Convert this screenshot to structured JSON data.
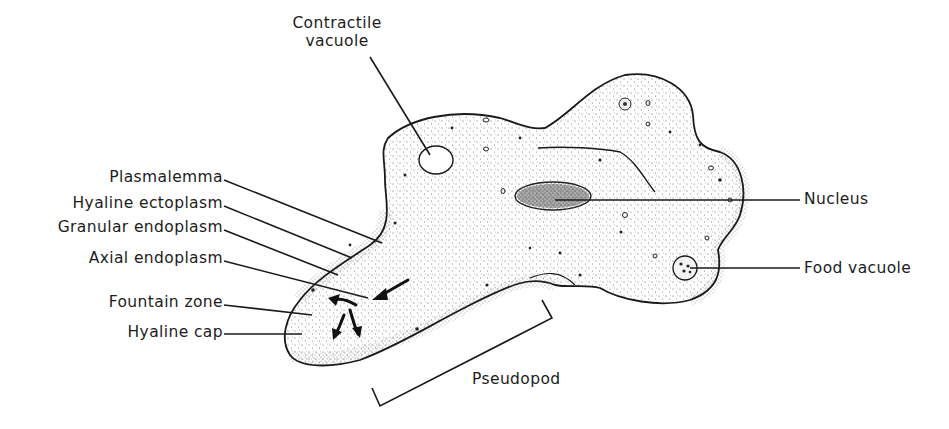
{
  "figure": {
    "colors": {
      "ink": "#1a1a1a",
      "background": "#ffffff",
      "stipple": "#3a3a3a"
    }
  },
  "labels": {
    "contractile_vacuole": [
      "Contractile",
      "vacuole"
    ],
    "plasmalemma": "Plasmalemma",
    "hyaline_ectoplasm": "Hyaline ectoplasm",
    "granular_endoplasm": "Granular endoplasm",
    "axial_endoplasm": "Axial endoplasm",
    "fountain_zone": "Fountain zone",
    "hyaline_cap": "Hyaline cap",
    "nucleus": "Nucleus",
    "food_vacuole": "Food vacuole",
    "pseudopod": "Pseudopod"
  }
}
